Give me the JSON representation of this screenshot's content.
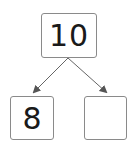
{
  "diagram": {
    "type": "number-bond",
    "whole": "10",
    "parts": [
      {
        "value": "8"
      },
      {
        "value": ""
      }
    ],
    "colors": {
      "border": "#8a8a8a",
      "arrow": "#555555",
      "text": "#1a1a1a"
    }
  }
}
